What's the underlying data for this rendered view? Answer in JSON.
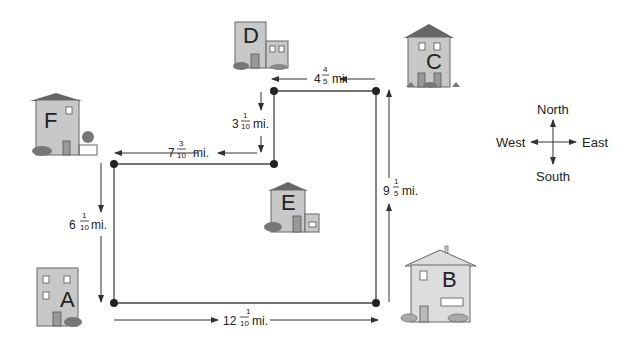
{
  "diagram": {
    "houses": [
      {
        "id": "A",
        "label": "A"
      },
      {
        "id": "B",
        "label": "B"
      },
      {
        "id": "C",
        "label": "C"
      },
      {
        "id": "D",
        "label": "D"
      },
      {
        "id": "E",
        "label": "E"
      },
      {
        "id": "F",
        "label": "F"
      }
    ],
    "distances": {
      "d_to_c": {
        "whole": "4",
        "num": "4",
        "den": "5",
        "unit": "mi."
      },
      "d_down": {
        "whole": "3",
        "num": "1",
        "den": "10",
        "unit": "mi."
      },
      "f_to_e": {
        "whole": "7",
        "num": "3",
        "den": "10",
        "unit": "mi."
      },
      "f_to_a": {
        "whole": "6",
        "num": "1",
        "den": "10",
        "unit": "mi."
      },
      "a_to_b": {
        "whole": "12",
        "num": "1",
        "den": "10",
        "unit": "mi."
      },
      "b_to_c": {
        "whole": "9",
        "num": "1",
        "den": "5",
        "unit": "mi."
      }
    },
    "compass": {
      "north": "North",
      "south": "South",
      "east": "East",
      "west": "West"
    },
    "colors": {
      "house_fill": "#c8c8c8",
      "house_stroke": "#666666",
      "door": "#a0a0a0",
      "roof": "#555555",
      "line": "#333333",
      "bush": "#777777"
    }
  }
}
